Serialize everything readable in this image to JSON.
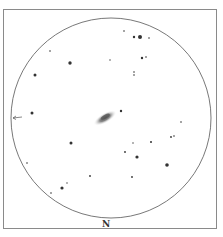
{
  "sketch": {
    "orientation_label": "N",
    "field": {
      "cx": 111,
      "cy": 118,
      "r": 100,
      "stroke": "#555555"
    },
    "galaxy": {
      "cx": 105,
      "cy": 118,
      "rx": 13,
      "ry": 5,
      "angle": -30,
      "color": "#6a6a6a"
    },
    "pointer_arrow": {
      "x1": 13,
      "y1": 118,
      "x2": 22,
      "y2": 117
    },
    "stars": [
      {
        "x": 124,
        "y": 31,
        "r": 0.8
      },
      {
        "x": 134,
        "y": 37,
        "r": 1.2
      },
      {
        "x": 140,
        "y": 37,
        "r": 2
      },
      {
        "x": 149,
        "y": 38,
        "r": 0.8
      },
      {
        "x": 50,
        "y": 51,
        "r": 0.8
      },
      {
        "x": 70,
        "y": 63,
        "r": 1.7
      },
      {
        "x": 110,
        "y": 60,
        "r": 0.7
      },
      {
        "x": 142,
        "y": 58,
        "r": 1.2
      },
      {
        "x": 146,
        "y": 57,
        "r": 0.8
      },
      {
        "x": 35,
        "y": 75,
        "r": 1.5
      },
      {
        "x": 134,
        "y": 72,
        "r": 0.8
      },
      {
        "x": 134,
        "y": 75,
        "r": 0.8
      },
      {
        "x": 121,
        "y": 111,
        "r": 1.2
      },
      {
        "x": 32,
        "y": 113,
        "r": 1.5
      },
      {
        "x": 181,
        "y": 122,
        "r": 0.8
      },
      {
        "x": 171,
        "y": 137,
        "r": 0.9
      },
      {
        "x": 174,
        "y": 136,
        "r": 0.8
      },
      {
        "x": 71,
        "y": 143,
        "r": 1.5
      },
      {
        "x": 133,
        "y": 143,
        "r": 0.7
      },
      {
        "x": 151,
        "y": 142,
        "r": 1
      },
      {
        "x": 125,
        "y": 152,
        "r": 0.9
      },
      {
        "x": 137,
        "y": 157,
        "r": 1.6
      },
      {
        "x": 27,
        "y": 163,
        "r": 0.8
      },
      {
        "x": 167,
        "y": 165,
        "r": 1.8
      },
      {
        "x": 90,
        "y": 176,
        "r": 0.9
      },
      {
        "x": 132,
        "y": 177,
        "r": 0.9
      },
      {
        "x": 67,
        "y": 183,
        "r": 0.7
      },
      {
        "x": 62,
        "y": 188,
        "r": 1.6
      },
      {
        "x": 51,
        "y": 193,
        "r": 0.8
      }
    ]
  }
}
